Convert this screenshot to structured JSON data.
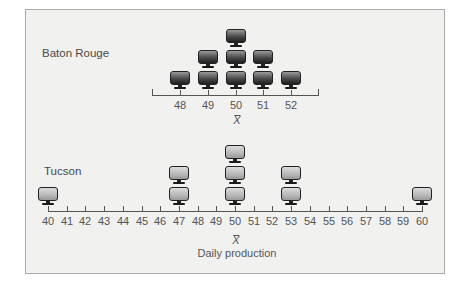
{
  "chart_data": [
    {
      "type": "pictograph-dotplot",
      "title": "Baton Rouge",
      "xlabel": "X̄",
      "ylabel": "",
      "categories": [
        "48",
        "49",
        "50",
        "51",
        "52"
      ],
      "x": [
        48,
        49,
        50,
        51,
        52
      ],
      "values": [
        1,
        2,
        3,
        2,
        1
      ],
      "xlim": [
        47,
        53
      ],
      "mean_marker": 50,
      "marker": "monitor-icon-dark",
      "grid": false
    },
    {
      "type": "pictograph-dotplot",
      "title": "Tucson",
      "xlabel": "Daily production",
      "mean_label": "X̄",
      "ylabel": "",
      "categories": [
        "40",
        "41",
        "42",
        "43",
        "44",
        "45",
        "46",
        "47",
        "48",
        "49",
        "50",
        "51",
        "52",
        "53",
        "54",
        "55",
        "56",
        "57",
        "58",
        "59",
        "60"
      ],
      "x": [
        40,
        47,
        50,
        53,
        60
      ],
      "values": [
        1,
        2,
        3,
        2,
        1
      ],
      "xlim": [
        40,
        60
      ],
      "mean_marker": 50,
      "marker": "monitor-icon-light",
      "grid": false
    }
  ],
  "panels": {
    "baton_rouge": {
      "label": "Baton Rouge",
      "ticks": [
        "48",
        "49",
        "50",
        "51",
        "52"
      ],
      "mean_symbol": "X",
      "stacks": [
        {
          "x": 48,
          "count": 1
        },
        {
          "x": 49,
          "count": 2
        },
        {
          "x": 50,
          "count": 3
        },
        {
          "x": 51,
          "count": 2
        },
        {
          "x": 52,
          "count": 1
        }
      ]
    },
    "tucson": {
      "label": "Tucson",
      "ticks": [
        "40",
        "41",
        "42",
        "43",
        "44",
        "45",
        "46",
        "47",
        "48",
        "49",
        "50",
        "51",
        "52",
        "53",
        "54",
        "55",
        "56",
        "57",
        "58",
        "59",
        "60"
      ],
      "mean_symbol": "X",
      "axis_title": "Daily production",
      "stacks": [
        {
          "x": 40,
          "count": 1
        },
        {
          "x": 47,
          "count": 2
        },
        {
          "x": 50,
          "count": 3
        },
        {
          "x": 53,
          "count": 2
        },
        {
          "x": 60,
          "count": 1
        }
      ]
    }
  },
  "colors": {
    "frame_bg": "#f1f1f0",
    "frame_border": "#a9a9a9",
    "axis": "#555555",
    "monitor_dark": "#1e1e1e",
    "monitor_light": "#b8b8b8"
  }
}
